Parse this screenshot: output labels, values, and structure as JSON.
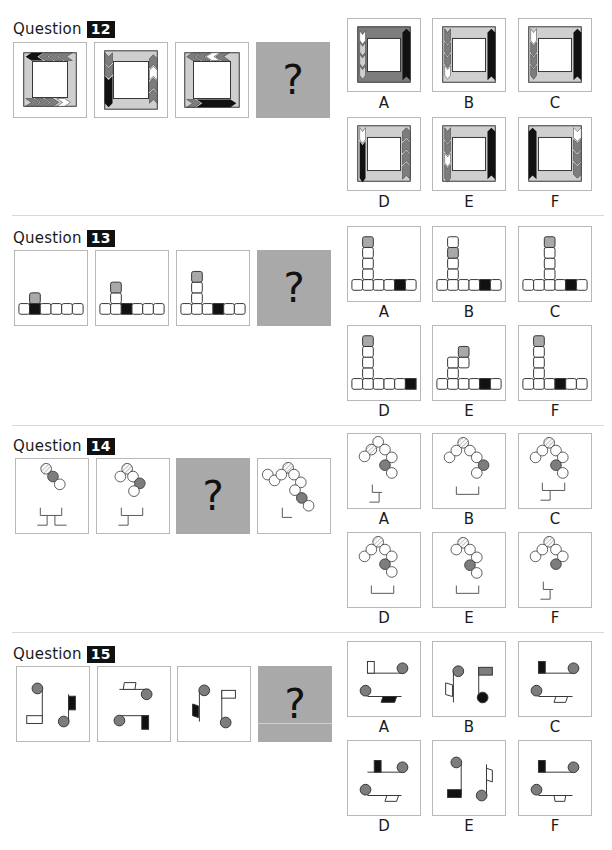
{
  "questions": [
    {
      "title": "Question",
      "number": "12",
      "sequence_count": 3,
      "missing_position": 4,
      "missing_symbol": "?",
      "options": [
        "A",
        "B",
        "C",
        "D",
        "E",
        "F"
      ]
    },
    {
      "title": "Question",
      "number": "13",
      "sequence_count": 3,
      "missing_position": 4,
      "missing_symbol": "?",
      "options": [
        "A",
        "B",
        "C",
        "D",
        "E",
        "F"
      ]
    },
    {
      "title": "Question",
      "number": "14",
      "sequence_count": 3,
      "missing_position": 3,
      "missing_symbol": "?",
      "options": [
        "A",
        "B",
        "C",
        "D",
        "E",
        "F"
      ]
    },
    {
      "title": "Question",
      "number": "15",
      "sequence_count": 3,
      "missing_position": 4,
      "missing_symbol": "?",
      "options": [
        "A",
        "B",
        "C",
        "D",
        "E",
        "F"
      ]
    }
  ],
  "colors": {
    "dark": "#111111",
    "mid_gray": "#7d7d7d",
    "light_gray": "#cfcfcf",
    "placeholder_bg": "#a9a9a9",
    "frame_border": "#b8b8b8"
  }
}
